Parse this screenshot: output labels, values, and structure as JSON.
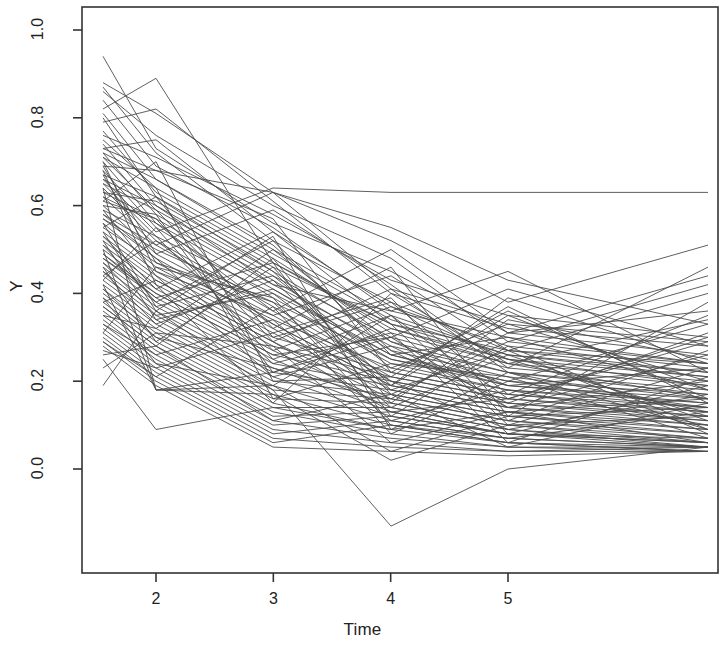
{
  "chart_data": {
    "type": "line",
    "title": "",
    "subtitle": "",
    "xlabel": "Time",
    "ylabel": "Y",
    "grid": false,
    "legend": "none",
    "xlim": [
      1.5,
      6.75
    ],
    "ylim": [
      -0.18,
      1.06
    ],
    "x_ticks": [
      2,
      3,
      4,
      5
    ],
    "x_tick_labels": [
      "2",
      "3",
      "4",
      "5"
    ],
    "y_ticks": [
      0.0,
      0.2,
      0.4,
      0.6,
      0.8,
      1.0
    ],
    "y_tick_labels": [
      "0.0",
      "0.2",
      "0.4",
      "0.6",
      "0.8",
      "1.0"
    ],
    "line_color": "#4d4d4d",
    "line_width": 0.9,
    "box_color": "#333333",
    "x": [
      1.5,
      2,
      3,
      4,
      5,
      5.5
    ],
    "series": [
      {
        "name": "s1",
        "values": [
          0.94,
          0.73,
          0.56,
          0.45,
          0.31,
          0.26
        ]
      },
      {
        "name": "s2",
        "values": [
          0.88,
          0.81,
          0.63,
          0.41,
          0.33,
          0.29
        ]
      },
      {
        "name": "s3",
        "values": [
          0.87,
          0.72,
          0.52,
          0.38,
          0.27,
          0.22
        ]
      },
      {
        "name": "s4",
        "values": [
          0.84,
          0.69,
          0.55,
          0.36,
          0.3,
          0.24
        ]
      },
      {
        "name": "s5",
        "values": [
          0.82,
          0.89,
          0.47,
          0.33,
          0.25,
          0.19
        ]
      },
      {
        "name": "s6",
        "values": [
          0.81,
          0.66,
          0.5,
          0.35,
          0.26,
          0.21
        ]
      },
      {
        "name": "s7",
        "values": [
          0.79,
          0.82,
          0.61,
          0.4,
          0.32,
          0.28
        ]
      },
      {
        "name": "s8",
        "values": [
          0.77,
          0.63,
          0.48,
          0.31,
          0.24,
          0.2
        ]
      },
      {
        "name": "s9",
        "values": [
          0.76,
          0.71,
          0.58,
          0.43,
          0.35,
          0.3
        ]
      },
      {
        "name": "s10",
        "values": [
          0.74,
          0.6,
          0.45,
          0.29,
          0.22,
          0.17
        ]
      },
      {
        "name": "s11",
        "values": [
          0.73,
          0.75,
          0.54,
          0.37,
          0.28,
          0.23
        ]
      },
      {
        "name": "s12",
        "values": [
          0.72,
          0.58,
          0.43,
          0.27,
          0.21,
          0.16
        ]
      },
      {
        "name": "s13",
        "values": [
          0.71,
          0.64,
          0.49,
          0.34,
          0.26,
          0.22
        ]
      },
      {
        "name": "s14",
        "values": [
          0.7,
          0.56,
          0.41,
          0.26,
          0.19,
          0.15
        ]
      },
      {
        "name": "s15",
        "values": [
          0.69,
          0.68,
          0.63,
          0.55,
          0.43,
          0.33
        ]
      },
      {
        "name": "s16",
        "values": [
          0.68,
          0.55,
          0.39,
          0.24,
          0.18,
          0.14
        ]
      },
      {
        "name": "s17",
        "values": [
          0.67,
          0.62,
          0.47,
          0.32,
          0.25,
          0.21
        ]
      },
      {
        "name": "s18",
        "values": [
          0.66,
          0.54,
          0.64,
          0.63,
          0.63,
          0.63
        ]
      },
      {
        "name": "s19",
        "values": [
          0.65,
          0.59,
          0.44,
          0.3,
          0.23,
          0.19
        ]
      },
      {
        "name": "s20",
        "values": [
          0.64,
          0.52,
          0.37,
          0.22,
          0.17,
          0.13
        ]
      },
      {
        "name": "s21",
        "values": [
          0.63,
          0.61,
          0.46,
          0.33,
          0.27,
          0.24
        ]
      },
      {
        "name": "s22",
        "values": [
          0.62,
          0.51,
          0.36,
          0.21,
          0.16,
          0.12
        ]
      },
      {
        "name": "s23",
        "values": [
          0.61,
          0.57,
          0.42,
          0.28,
          0.22,
          0.18
        ]
      },
      {
        "name": "s24",
        "values": [
          0.6,
          0.49,
          0.35,
          0.2,
          0.15,
          0.11
        ]
      },
      {
        "name": "s25",
        "values": [
          0.59,
          0.53,
          0.4,
          0.26,
          0.2,
          0.17
        ]
      },
      {
        "name": "s26",
        "values": [
          0.58,
          0.48,
          0.33,
          0.19,
          0.14,
          0.1
        ]
      },
      {
        "name": "s27",
        "values": [
          0.57,
          0.5,
          0.38,
          0.25,
          0.19,
          0.16
        ]
      },
      {
        "name": "s28",
        "values": [
          0.56,
          0.46,
          0.32,
          0.18,
          0.13,
          0.09
        ]
      },
      {
        "name": "s29",
        "values": [
          0.55,
          0.47,
          0.34,
          0.23,
          0.18,
          0.15
        ]
      },
      {
        "name": "s30",
        "values": [
          0.54,
          0.45,
          0.31,
          0.17,
          0.12,
          0.08
        ]
      },
      {
        "name": "s31",
        "values": [
          0.53,
          0.44,
          0.3,
          0.22,
          0.17,
          0.14
        ]
      },
      {
        "name": "s32",
        "values": [
          0.52,
          0.43,
          0.29,
          0.16,
          0.11,
          0.07
        ]
      },
      {
        "name": "s33",
        "values": [
          0.51,
          0.42,
          0.28,
          0.21,
          0.16,
          0.13
        ]
      },
      {
        "name": "s34",
        "values": [
          0.5,
          0.41,
          0.27,
          0.15,
          0.1,
          0.06
        ]
      },
      {
        "name": "s35",
        "values": [
          0.49,
          0.4,
          0.26,
          0.2,
          0.15,
          0.12
        ]
      },
      {
        "name": "s36",
        "values": [
          0.48,
          0.39,
          0.25,
          0.14,
          0.09,
          0.05
        ]
      },
      {
        "name": "s37",
        "values": [
          0.47,
          0.38,
          0.24,
          0.19,
          0.14,
          0.11
        ]
      },
      {
        "name": "s38",
        "values": [
          0.46,
          0.37,
          0.23,
          0.13,
          0.08,
          0.05
        ]
      },
      {
        "name": "s39",
        "values": [
          0.45,
          0.36,
          0.22,
          0.18,
          0.13,
          0.1
        ]
      },
      {
        "name": "s40",
        "values": [
          0.44,
          0.35,
          0.21,
          0.12,
          0.08,
          0.06
        ]
      },
      {
        "name": "s41",
        "values": [
          0.43,
          0.34,
          0.2,
          0.17,
          0.12,
          0.09
        ]
      },
      {
        "name": "s42",
        "values": [
          0.42,
          0.33,
          0.19,
          0.11,
          0.07,
          0.05
        ]
      },
      {
        "name": "s43",
        "values": [
          0.41,
          0.32,
          0.18,
          0.16,
          0.11,
          0.08
        ]
      },
      {
        "name": "s44",
        "values": [
          0.4,
          0.31,
          0.17,
          0.1,
          0.06,
          0.04
        ]
      },
      {
        "name": "s45",
        "values": [
          0.39,
          0.3,
          0.16,
          0.15,
          0.1,
          0.07
        ]
      },
      {
        "name": "s46",
        "values": [
          0.38,
          0.29,
          0.15,
          0.09,
          0.06,
          0.04
        ]
      },
      {
        "name": "s47",
        "values": [
          0.37,
          0.28,
          0.14,
          0.14,
          0.09,
          0.06
        ]
      },
      {
        "name": "s48",
        "values": [
          0.36,
          0.27,
          0.13,
          0.08,
          0.05,
          0.04
        ]
      },
      {
        "name": "s49",
        "values": [
          0.35,
          0.26,
          0.12,
          0.13,
          0.08,
          0.06
        ]
      },
      {
        "name": "s50",
        "values": [
          0.34,
          0.25,
          0.11,
          0.07,
          0.05,
          0.05
        ]
      },
      {
        "name": "s51",
        "values": [
          0.33,
          0.24,
          0.1,
          0.12,
          0.08,
          0.07
        ]
      },
      {
        "name": "s52",
        "values": [
          0.32,
          0.23,
          0.09,
          0.06,
          0.04,
          0.04
        ]
      },
      {
        "name": "s53",
        "values": [
          0.31,
          0.22,
          0.08,
          0.11,
          0.07,
          0.05
        ]
      },
      {
        "name": "s54",
        "values": [
          0.3,
          0.21,
          0.07,
          0.05,
          0.04,
          0.05
        ]
      },
      {
        "name": "s55",
        "values": [
          0.29,
          0.2,
          0.06,
          0.1,
          0.06,
          0.05
        ]
      },
      {
        "name": "s56",
        "values": [
          0.28,
          0.19,
          0.05,
          0.04,
          0.03,
          0.04
        ]
      },
      {
        "name": "s57",
        "values": [
          0.5,
          0.18,
          0.17,
          0.02,
          0.1,
          0.12
        ]
      },
      {
        "name": "s58",
        "values": [
          0.19,
          0.36,
          0.18,
          -0.13,
          0.0,
          0.05
        ]
      },
      {
        "name": "s59",
        "values": [
          0.64,
          0.18,
          0.19,
          0.04,
          0.12,
          0.14
        ]
      },
      {
        "name": "s60",
        "values": [
          0.25,
          0.09,
          0.14,
          0.09,
          0.13,
          0.16
        ]
      },
      {
        "name": "s61",
        "values": [
          0.58,
          0.51,
          0.63,
          0.52,
          0.38,
          0.51
        ]
      },
      {
        "name": "s62",
        "values": [
          0.62,
          0.56,
          0.36,
          0.5,
          0.31,
          0.44
        ]
      },
      {
        "name": "s63",
        "values": [
          0.66,
          0.6,
          0.42,
          0.36,
          0.45,
          0.22
        ]
      },
      {
        "name": "s64",
        "values": [
          0.7,
          0.45,
          0.35,
          0.44,
          0.27,
          0.4
        ]
      },
      {
        "name": "s65",
        "values": [
          0.55,
          0.62,
          0.3,
          0.38,
          0.17,
          0.35
        ]
      },
      {
        "name": "s66",
        "values": [
          0.48,
          0.4,
          0.26,
          0.3,
          0.41,
          0.28
        ]
      },
      {
        "name": "s67",
        "values": [
          0.44,
          0.52,
          0.33,
          0.19,
          0.35,
          0.18
        ]
      },
      {
        "name": "s68",
        "values": [
          0.52,
          0.34,
          0.41,
          0.25,
          0.2,
          0.33
        ]
      },
      {
        "name": "s69",
        "values": [
          0.6,
          0.58,
          0.22,
          0.32,
          0.24,
          0.16
        ]
      },
      {
        "name": "s70",
        "values": [
          0.46,
          0.29,
          0.46,
          0.17,
          0.29,
          0.24
        ]
      },
      {
        "name": "s71",
        "values": [
          0.72,
          0.66,
          0.51,
          0.27,
          0.14,
          0.26
        ]
      },
      {
        "name": "s72",
        "values": [
          0.38,
          0.43,
          0.29,
          0.41,
          0.22,
          0.13
        ]
      },
      {
        "name": "s73",
        "values": [
          0.56,
          0.37,
          0.44,
          0.23,
          0.33,
          0.2
        ]
      },
      {
        "name": "s74",
        "values": [
          0.43,
          0.55,
          0.25,
          0.35,
          0.16,
          0.3
        ]
      },
      {
        "name": "s75",
        "values": [
          0.67,
          0.47,
          0.38,
          0.14,
          0.26,
          0.11
        ]
      },
      {
        "name": "s76",
        "values": [
          0.35,
          0.32,
          0.5,
          0.29,
          0.19,
          0.23
        ]
      },
      {
        "name": "s77",
        "values": [
          0.61,
          0.7,
          0.2,
          0.21,
          0.37,
          0.15
        ]
      },
      {
        "name": "s78",
        "values": [
          0.49,
          0.39,
          0.47,
          0.12,
          0.28,
          0.09
        ]
      },
      {
        "name": "s79",
        "values": [
          0.27,
          0.23,
          0.31,
          0.39,
          0.11,
          0.27
        ]
      },
      {
        "name": "s80",
        "values": [
          0.75,
          0.64,
          0.16,
          0.24,
          0.21,
          0.07
        ]
      },
      {
        "name": "s81",
        "values": [
          0.53,
          0.41,
          0.54,
          0.33,
          0.08,
          0.19
        ]
      },
      {
        "name": "s82",
        "values": [
          0.41,
          0.3,
          0.23,
          0.16,
          0.31,
          0.36
        ]
      },
      {
        "name": "s83",
        "values": [
          0.69,
          0.49,
          0.59,
          0.42,
          0.23,
          0.46
        ]
      },
      {
        "name": "s84",
        "values": [
          0.33,
          0.26,
          0.34,
          0.11,
          0.18,
          0.1
        ]
      },
      {
        "name": "s85",
        "values": [
          0.59,
          0.44,
          0.21,
          0.28,
          0.15,
          0.31
        ]
      },
      {
        "name": "s86",
        "values": [
          0.47,
          0.35,
          0.4,
          0.2,
          0.09,
          0.17
        ]
      },
      {
        "name": "s87",
        "values": [
          0.65,
          0.53,
          0.27,
          0.37,
          0.25,
          0.12
        ]
      },
      {
        "name": "s88",
        "values": [
          0.37,
          0.28,
          0.48,
          0.15,
          0.34,
          0.25
        ]
      },
      {
        "name": "s89",
        "values": [
          0.71,
          0.59,
          0.32,
          0.46,
          0.12,
          0.38
        ]
      },
      {
        "name": "s90",
        "values": [
          0.29,
          0.21,
          0.37,
          0.08,
          0.2,
          0.14
        ]
      },
      {
        "name": "s91",
        "values": [
          0.57,
          0.48,
          0.24,
          0.31,
          0.06,
          0.21
        ]
      },
      {
        "name": "s92",
        "values": [
          0.45,
          0.33,
          0.43,
          0.18,
          0.27,
          0.08
        ]
      },
      {
        "name": "s93",
        "values": [
          0.63,
          0.57,
          0.29,
          0.13,
          0.16,
          0.29
        ]
      },
      {
        "name": "s94",
        "values": [
          0.51,
          0.38,
          0.52,
          0.26,
          0.3,
          0.18
        ]
      },
      {
        "name": "s95",
        "values": [
          0.39,
          0.24,
          0.19,
          0.35,
          0.1,
          0.23
        ]
      },
      {
        "name": "s96",
        "values": [
          0.73,
          0.68,
          0.57,
          0.22,
          0.36,
          0.16
        ]
      },
      {
        "name": "s97",
        "values": [
          0.23,
          0.31,
          0.28,
          0.06,
          0.13,
          0.06
        ]
      },
      {
        "name": "s98",
        "values": [
          0.68,
          0.42,
          0.15,
          0.4,
          0.24,
          0.34
        ]
      },
      {
        "name": "s99",
        "values": [
          0.31,
          0.46,
          0.39,
          0.1,
          0.07,
          0.13
        ]
      },
      {
        "name": "s100",
        "values": [
          0.86,
          0.76,
          0.6,
          0.48,
          0.29,
          0.42
        ]
      },
      {
        "name": "s101",
        "values": [
          0.8,
          0.62,
          0.45,
          0.19,
          0.39,
          0.24
        ]
      },
      {
        "name": "s102",
        "values": [
          0.42,
          0.18,
          0.22,
          0.3,
          0.14,
          0.2
        ]
      },
      {
        "name": "s103",
        "values": [
          0.54,
          0.36,
          0.53,
          0.09,
          0.22,
          0.09
        ]
      },
      {
        "name": "s104",
        "values": [
          0.26,
          0.28,
          0.11,
          0.17,
          0.05,
          0.15
        ]
      }
    ]
  },
  "axes": {
    "y_title": "Y",
    "x_title": "Time"
  }
}
